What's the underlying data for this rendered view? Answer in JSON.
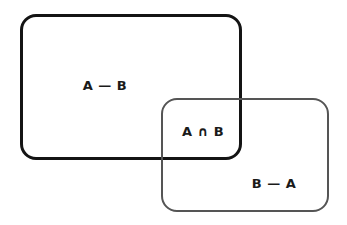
{
  "diagram": {
    "type": "venn-rectangles",
    "sets": [
      {
        "name": "A",
        "stroke": "#141414"
      },
      {
        "name": "B",
        "stroke": "#555555"
      }
    ],
    "regions": {
      "a_minus_b": "A — B",
      "intersection": "A ∩ B",
      "b_minus_a": "B — A"
    }
  }
}
